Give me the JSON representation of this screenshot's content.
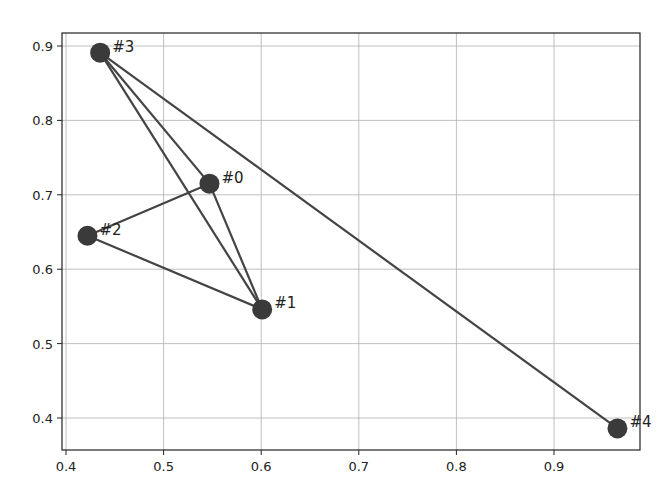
{
  "chart_data": {
    "type": "scatter",
    "title": "",
    "xlabel": "",
    "ylabel": "",
    "xlim": [
      0.395,
      0.99
    ],
    "ylim": [
      0.36,
      0.918
    ],
    "grid": true,
    "legend": null,
    "x_ticks": [
      "0.4",
      "0.5",
      "0.6",
      "0.7",
      "0.8",
      "0.9"
    ],
    "y_ticks": [
      "0.4",
      "0.5",
      "0.6",
      "0.7",
      "0.8",
      "0.9"
    ],
    "nodes": [
      {
        "id": 0,
        "label": "#0",
        "x": 0.547,
        "y": 0.715
      },
      {
        "id": 1,
        "label": "#1",
        "x": 0.601,
        "y": 0.546
      },
      {
        "id": 2,
        "label": "#2",
        "x": 0.422,
        "y": 0.645
      },
      {
        "id": 3,
        "label": "#3",
        "x": 0.435,
        "y": 0.891
      },
      {
        "id": 4,
        "label": "#4",
        "x": 0.965,
        "y": 0.386
      }
    ],
    "edges": [
      [
        3,
        0
      ],
      [
        3,
        1
      ],
      [
        3,
        4
      ],
      [
        0,
        2
      ],
      [
        0,
        1
      ],
      [
        2,
        1
      ]
    ],
    "colors": {
      "node": "#3a3a3a",
      "edge": "#444444",
      "grid": "#b0b0b0",
      "axes": "#222222"
    }
  }
}
